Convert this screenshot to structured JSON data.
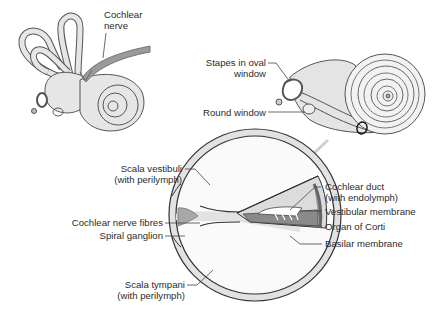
{
  "diagram": {
    "panels": [
      {
        "id": "inner-ear",
        "labels": [
          {
            "text_line1": "Cochlear",
            "text_line2": "nerve"
          }
        ]
      },
      {
        "id": "uncoiled-cochlea",
        "labels": [
          {
            "text_line1": "Stapes in oval",
            "text_line2": "window"
          },
          {
            "text_line1": "Round window"
          }
        ]
      },
      {
        "id": "cross-section",
        "labels_left": [
          {
            "text_line1": "Scala vestibuli",
            "text_line2": "(with perilymph)"
          },
          {
            "text_line1": "Cochlear nerve fibres"
          },
          {
            "text_line1": "Spiral ganglion"
          },
          {
            "text_line1": "Scala tympani",
            "text_line2": "(with perilymph)"
          }
        ],
        "labels_right": [
          {
            "text_line1": "Cochlear duct",
            "text_line2": "(with endolymph)"
          },
          {
            "text_line1": "Vestibular membrane"
          },
          {
            "text_line1": "Organ of Corti"
          },
          {
            "text_line1": "Basilar membrane"
          }
        ]
      }
    ],
    "colors": {
      "outline": "#3a3a3a",
      "fill_light": "#ececec",
      "fill_mid": "#bdbdbd",
      "fill_dark": "#8a8a8a",
      "arrow": "#c8c8c8",
      "background": "#ffffff"
    }
  }
}
